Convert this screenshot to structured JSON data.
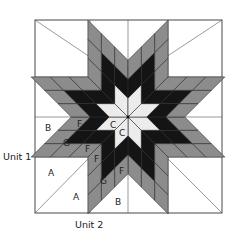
{
  "diagram": {
    "block": {
      "x0": 35,
      "y0": 20,
      "x1": 222,
      "y1": 213,
      "cx": 128,
      "cy": 117
    },
    "star": {
      "points": 8,
      "grid": 3,
      "diamond_side": 18.9,
      "colors": {
        "center": "#ececec",
        "ring1": "#141414",
        "ring2": "#8c8c8c",
        "background": "#ffffff",
        "outline": "#333333"
      }
    },
    "piece_labels": [
      {
        "text": "B",
        "x": 45,
        "y": 131
      },
      {
        "text": "F",
        "x": 77,
        "y": 127
      },
      {
        "text": "C",
        "x": 110,
        "y": 128
      },
      {
        "text": "C",
        "x": 119,
        "y": 136
      },
      {
        "text": "G",
        "x": 63,
        "y": 146
      },
      {
        "text": "F",
        "x": 85,
        "y": 152
      },
      {
        "text": "F",
        "x": 94,
        "y": 162
      },
      {
        "text": "A",
        "x": 48,
        "y": 176
      },
      {
        "text": "G",
        "x": 100,
        "y": 184
      },
      {
        "text": "F",
        "x": 119,
        "y": 174
      },
      {
        "text": "A",
        "x": 73,
        "y": 200
      },
      {
        "text": "B",
        "x": 115,
        "y": 205
      }
    ],
    "unit_labels": [
      {
        "text": "Unit 1",
        "x": 3,
        "y": 160
      },
      {
        "text": "Unit 2",
        "x": 75,
        "y": 228
      }
    ]
  }
}
